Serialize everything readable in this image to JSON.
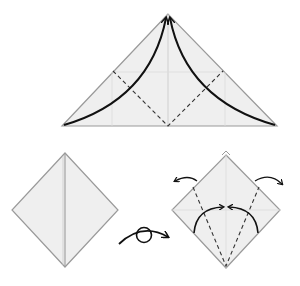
{
  "diagram": {
    "type": "origami-instructions",
    "colors": {
      "paper_fill": "#efefef",
      "paper_edge": "#9a9a9a",
      "crease": "#c8c8c8",
      "valley_fold": "#333333",
      "arrow": "#111111",
      "background": "#ffffff"
    },
    "steps": [
      {
        "id": "step-1",
        "shape": "triangle",
        "description": "Fold both bottom corners up to the top point along dashed valley folds"
      },
      {
        "id": "step-2",
        "shape": "diamond",
        "description": "Resulting square base (diamond shape)"
      },
      {
        "id": "step-3",
        "symbol": "turn-over",
        "description": "Turn the model over"
      },
      {
        "id": "step-4",
        "shape": "diamond",
        "description": "Fold lower edges to center along dashed lines; unfold top flaps outward"
      }
    ]
  }
}
